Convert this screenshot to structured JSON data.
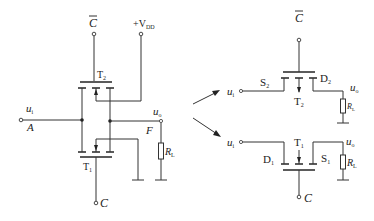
{
  "diagram": {
    "type": "circuit-schematic",
    "left_circuit": {
      "terminals": {
        "control_bar": "C",
        "supply": "+V",
        "supply_sub": "DD",
        "input": "u",
        "input_sub": "i",
        "input_node": "A",
        "output": "u",
        "output_sub": "o",
        "output_node": "F",
        "control": "C"
      },
      "transistors": [
        {
          "label": "T",
          "sub": "2"
        },
        {
          "label": "T",
          "sub": "1"
        }
      ],
      "load": {
        "label": "R",
        "sub": "L"
      }
    },
    "right_top": {
      "control_bar": "C",
      "input": "u",
      "input_sub": "i",
      "output": "u",
      "output_sub": "o",
      "source": "S",
      "source_sub": "2",
      "drain": "D",
      "drain_sub": "2",
      "transistor": "T",
      "transistor_sub": "2",
      "load": "R",
      "load_sub": "L"
    },
    "right_bottom": {
      "control": "C",
      "input": "u",
      "input_sub": "i",
      "output": "u",
      "output_sub": "o",
      "drain": "D",
      "drain_sub": "1",
      "source": "S",
      "source_sub": "1",
      "transistor": "T",
      "transistor_sub": "1",
      "load": "R",
      "load_sub": "L"
    }
  }
}
